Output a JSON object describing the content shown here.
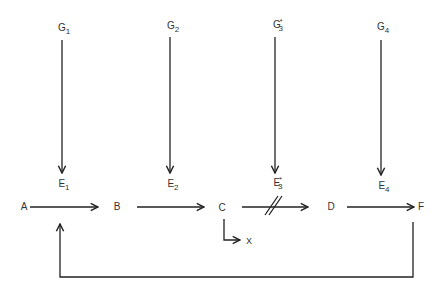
{
  "diagram": {
    "type": "metabolic pathway with enzyme regulation",
    "genes": [
      {
        "id": "G1",
        "base": "G",
        "sub": "1",
        "sup": ""
      },
      {
        "id": "G2",
        "base": "G",
        "sub": "2",
        "sup": ""
      },
      {
        "id": "G3*",
        "base": "G",
        "sub": "3",
        "sup": "*"
      },
      {
        "id": "G4",
        "base": "G",
        "sub": "4",
        "sup": ""
      }
    ],
    "enzymes": [
      {
        "id": "E1",
        "base": "E",
        "sub": "1",
        "sup": ""
      },
      {
        "id": "E2",
        "base": "E",
        "sub": "2",
        "sup": ""
      },
      {
        "id": "E3*",
        "base": "E",
        "sub": "3",
        "sup": "*"
      },
      {
        "id": "E4",
        "base": "E",
        "sub": "4",
        "sup": ""
      }
    ],
    "metabolites": {
      "A": "A",
      "B": "B",
      "C": "C",
      "D": "D",
      "F": "F",
      "X": "X"
    },
    "edges": [
      {
        "from": "G1",
        "to": "E1"
      },
      {
        "from": "G2",
        "to": "E2"
      },
      {
        "from": "G3*",
        "to": "E3*"
      },
      {
        "from": "G4",
        "to": "E4"
      },
      {
        "from": "A",
        "to": "B",
        "enzyme": "E1"
      },
      {
        "from": "B",
        "to": "C",
        "enzyme": "E2"
      },
      {
        "from": "C",
        "to": "D",
        "enzyme": "E3*",
        "blocked": true
      },
      {
        "from": "D",
        "to": "F",
        "enzyme": "E4"
      },
      {
        "from": "C",
        "to": "X",
        "shunt": true
      },
      {
        "from": "F",
        "to": "A-B step",
        "feedback": true
      }
    ]
  }
}
